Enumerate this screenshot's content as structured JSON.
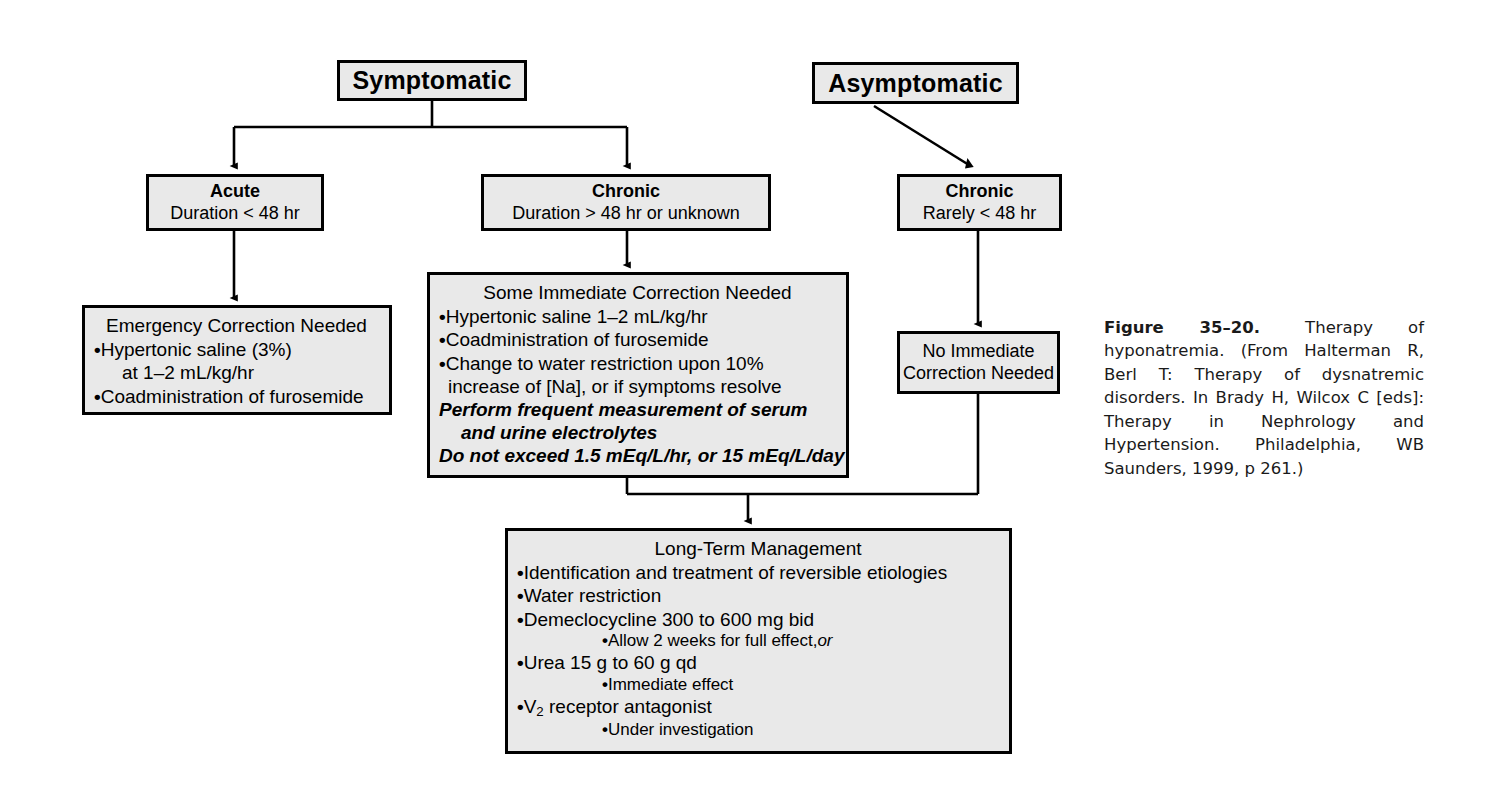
{
  "figure": {
    "caption_label": "Figure 35–20.",
    "caption_text": "Therapy of hyponatremia. (From Halterman R, Berl T: Therapy of dysnatremic disorders. In Brady H, Wilcox C [eds]: Therapy in Nephrology and Hypertension. Philadelphia, WB Saunders, 1999, p 261.)"
  },
  "nodes": {
    "symptomatic": {
      "title": "Symptomatic"
    },
    "asymptomatic": {
      "title": "Asymptomatic"
    },
    "acute": {
      "title": "Acute",
      "subtitle": "Duration < 48 hr"
    },
    "chronic_symptomatic": {
      "title": "Chronic",
      "subtitle": "Duration > 48 hr or unknown"
    },
    "chronic_asymptomatic": {
      "title": "Chronic",
      "subtitle": "Rarely < 48 hr"
    },
    "emergency_correction": {
      "heading": "Emergency Correction Needed",
      "items": [
        {
          "text": "Hypertonic saline (3%)",
          "bullet": true,
          "indent": 0
        },
        {
          "text": "at 1–2 mL/kg/hr",
          "bullet": false,
          "indent": 1
        },
        {
          "text": "Coadministration of furosemide",
          "bullet": true,
          "indent": 0
        }
      ]
    },
    "some_immediate_correction": {
      "heading": "Some Immediate Correction Needed",
      "items": [
        {
          "text": "Hypertonic saline 1–2 mL/kg/hr",
          "bullet": true,
          "indent": 0
        },
        {
          "text": "Coadministration of furosemide",
          "bullet": true,
          "indent": 0
        },
        {
          "text": "Change to water restriction upon 10%",
          "bullet": true,
          "indent": 0
        },
        {
          "text": "increase of [Na], or if symptoms resolve",
          "bullet": false,
          "indent": 0
        }
      ],
      "emphasis": [
        "Perform frequent measurement of serum",
        "and urine electrolytes",
        "Do not exceed 1.5 mEq/L/hr, or 15 mEq/L/day"
      ]
    },
    "no_immediate_correction": {
      "line1": "No Immediate",
      "line2": "Correction Needed"
    },
    "long_term_management": {
      "heading": "Long-Term Management",
      "items": [
        {
          "text": "Identification and treatment of reversible etiologies",
          "indent": 0
        },
        {
          "text": "Water restriction",
          "indent": 0
        },
        {
          "text": "Demeclocycline 300 to 600 mg bid",
          "indent": 0
        },
        {
          "text": "Allow 2 weeks for full effect,",
          "trailing_italic": "or",
          "indent": 2
        },
        {
          "text": "Urea 15 g to 60 g qd",
          "indent": 0
        },
        {
          "text": "Immediate effect",
          "indent": 2
        },
        {
          "text": "V2 receptor antagonist",
          "subscript": "2",
          "prefix": "V",
          "suffix": " receptor antagonist",
          "indent": 0
        },
        {
          "text": "Under investigation",
          "indent": 2
        }
      ]
    }
  },
  "colors": {
    "box_fill": "#e9e9e9",
    "box_border": "#000000",
    "text": "#000000",
    "page_background": "#ffffff"
  }
}
